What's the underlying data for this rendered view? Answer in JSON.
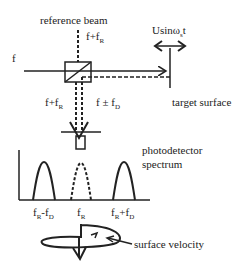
{
  "labels": {
    "reference_beam": "reference beam",
    "input_freq": "f",
    "ref_freq_main": "f+f",
    "ref_freq_sub": "R",
    "target_motion_main": "Usinω",
    "target_motion_sub": "s",
    "target_motion_suffix": "t",
    "target_surface": "target surface",
    "left_beam_main": "f+f",
    "left_beam_sub": "R",
    "right_beam_main": "f ± f",
    "right_beam_sub": "D",
    "photodetector_line1": "photodetector",
    "photodetector_line2": "spectrum",
    "tick_left_main": "f",
    "tick_left_sub1": "R",
    "tick_left_mid": "-f",
    "tick_left_sub2": "D",
    "tick_center_main": "f",
    "tick_center_sub": "R",
    "tick_right_main": "f",
    "tick_right_sub1": "R",
    "tick_right_mid": "+f",
    "tick_right_sub2": "D",
    "surface_velocity": "surface velocity"
  },
  "colors": {
    "line": "#222222",
    "background": "#ffffff"
  }
}
